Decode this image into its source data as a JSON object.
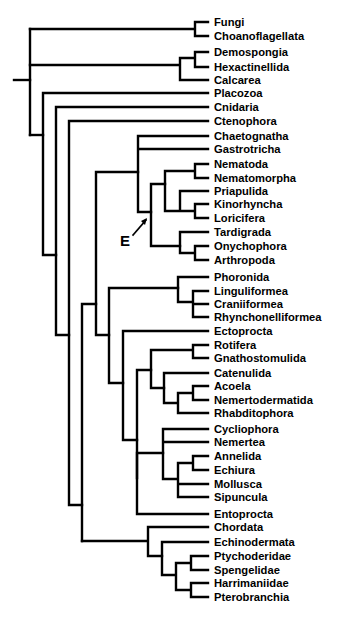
{
  "figure": {
    "title": "",
    "annotation": {
      "label": "E"
    },
    "taxa": [
      {
        "name": "Fungi",
        "y": 22
      },
      {
        "name": "Choanoflagellata",
        "y": 36
      },
      {
        "name": "Demospongia",
        "y": 52
      },
      {
        "name": "Hexactinellida",
        "y": 67
      },
      {
        "name": "Calcarea",
        "y": 80
      },
      {
        "name": "Placozoa",
        "y": 93
      },
      {
        "name": "Cnidaria",
        "y": 107
      },
      {
        "name": "Ctenophora",
        "y": 121
      },
      {
        "name": "Chaetognatha",
        "y": 136
      },
      {
        "name": "Gastrotricha",
        "y": 149
      },
      {
        "name": "Nematoda",
        "y": 164
      },
      {
        "name": "Nematomorpha",
        "y": 178
      },
      {
        "name": "Priapulida",
        "y": 191
      },
      {
        "name": "Kinorhyncha",
        "y": 204
      },
      {
        "name": "Loricifera",
        "y": 218
      },
      {
        "name": "Tardigrada",
        "y": 232
      },
      {
        "name": "Onychophora",
        "y": 246
      },
      {
        "name": "Arthropoda",
        "y": 260
      },
      {
        "name": "Phoronida",
        "y": 277
      },
      {
        "name": "Linguliformea",
        "y": 291
      },
      {
        "name": "Craniiformea",
        "y": 304
      },
      {
        "name": "Rhynchonelliformea",
        "y": 317
      },
      {
        "name": "Ectoprocta",
        "y": 331
      },
      {
        "name": "Rotifera",
        "y": 345
      },
      {
        "name": "Gnathostomulida",
        "y": 358
      },
      {
        "name": "Catenulida",
        "y": 373
      },
      {
        "name": "Acoela",
        "y": 386
      },
      {
        "name": "Nemertodermatida",
        "y": 400
      },
      {
        "name": "Rhabditophora",
        "y": 413
      },
      {
        "name": "Cycliophora",
        "y": 429
      },
      {
        "name": "Nemertea",
        "y": 442
      },
      {
        "name": "Annelida",
        "y": 456
      },
      {
        "name": "Echiura",
        "y": 470
      },
      {
        "name": "Mollusca",
        "y": 484
      },
      {
        "name": "Sipuncula",
        "y": 497
      },
      {
        "name": "Entoprocta",
        "y": 514
      },
      {
        "name": "Chordata",
        "y": 527
      },
      {
        "name": "Echinodermata",
        "y": 542
      },
      {
        "name": "Ptychoderidae",
        "y": 556
      },
      {
        "name": "Spengelidae",
        "y": 570
      },
      {
        "name": "Harrimaniidae",
        "y": 583
      },
      {
        "name": "Pterobranchia",
        "y": 597
      }
    ]
  }
}
